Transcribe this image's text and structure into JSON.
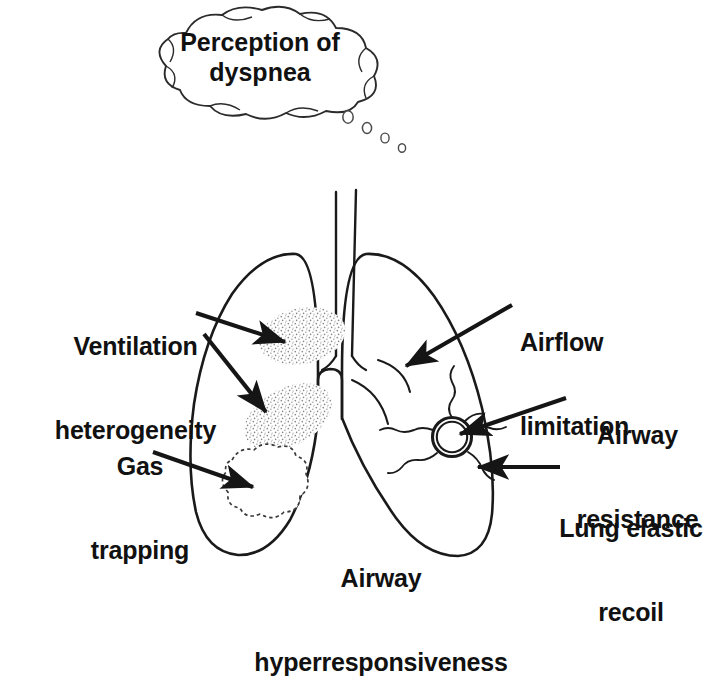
{
  "figure": {
    "type": "medical-diagram",
    "background_color": "#ffffff",
    "line_color": "#1a1a1a",
    "text_color": "#111111"
  },
  "thought_bubble": {
    "line1": "Perception of",
    "line2": "dyspnea",
    "trail_dot_count": 4
  },
  "labels": {
    "ventilation_heterogeneity": {
      "line1": "Ventilation",
      "line2": "heterogeneity"
    },
    "gas_trapping": {
      "line1": "Gas",
      "line2": "trapping"
    },
    "airflow_limitation": {
      "line1": "Airflow",
      "line2": "limitation"
    },
    "airway_resistance": {
      "line1": "Airway",
      "line2": "resistance"
    },
    "lung_elastic_recoil": {
      "line1": "Lung elastic",
      "line2": "recoil"
    },
    "airway_hyperresponsiveness": {
      "line1": "Airway",
      "line2": "hyperresponsiveness"
    }
  },
  "anatomy": {
    "trachea": "trachea",
    "carina": "carina",
    "left_lung": "left-lung",
    "right_lung": "right-lung",
    "airway_cross_section": "airway-cross-section",
    "stipple_patch_upper": "ventilation-heterogeneity-patch-upper",
    "stipple_patch_lower": "ventilation-heterogeneity-patch-lower",
    "gas_trapping_cloud": "gas-trapping-cloud",
    "airflow_limitation_arc": "airflow-limitation-arc"
  },
  "arrows": [
    {
      "name": "arrow-ventilation-heterogeneity-upper",
      "points_to": "stipple_patch_upper"
    },
    {
      "name": "arrow-ventilation-heterogeneity-lower",
      "points_to": "stipple_patch_lower"
    },
    {
      "name": "arrow-gas-trapping",
      "points_to": "gas_trapping_cloud"
    },
    {
      "name": "arrow-airflow-limitation",
      "points_to": "airflow_limitation_arc"
    },
    {
      "name": "arrow-airway-resistance",
      "points_to": "airway_cross_section"
    },
    {
      "name": "arrow-lung-elastic-recoil",
      "points_to": "right_lung"
    }
  ]
}
